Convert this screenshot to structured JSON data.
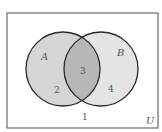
{
  "diagram": {
    "type": "venn",
    "universe_label": "U",
    "sets": [
      {
        "name": "A",
        "label": "A"
      },
      {
        "name": "B",
        "label": "B"
      }
    ],
    "regions": [
      {
        "id": "outside",
        "label": "1"
      },
      {
        "id": "A_only",
        "label": "2"
      },
      {
        "id": "A_and_B",
        "label": "3"
      },
      {
        "id": "B_only",
        "label": "4"
      }
    ],
    "colors": {
      "background": "#ffffff",
      "universe_border": "#6b6b6b",
      "circle_stroke": "#2a2a2a",
      "set_a_fill": "#d6d6d6",
      "set_b_fill": "#e4e4e4",
      "intersection_fill": "#b7b7b7",
      "text": "#555555"
    }
  }
}
